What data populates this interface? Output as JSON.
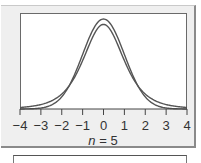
{
  "chart_data": {
    "type": "line",
    "title": "",
    "xlabel": "n = 5",
    "xlabel_var": "n",
    "xlabel_rest": " = 5",
    "ylabel": "",
    "xlim": [
      -4,
      4
    ],
    "grid": false,
    "legend": null,
    "x_ticks": [
      "−4",
      "−3",
      "−2",
      "−1",
      "0",
      "1",
      "2",
      "3",
      "4"
    ],
    "series": [
      {
        "name": "Standard normal distribution",
        "description": "taller peak, thinner tails",
        "x": [
          -4,
          -3,
          -2,
          -1,
          0,
          1,
          2,
          3,
          4
        ],
        "y": [
          0.0001,
          0.0044,
          0.054,
          0.242,
          0.399,
          0.242,
          0.054,
          0.0044,
          0.0001
        ]
      },
      {
        "name": "t-distribution (df = 4)",
        "description": "lower peak, heavier tails",
        "x": [
          -4,
          -3,
          -2,
          -1,
          0,
          1,
          2,
          3,
          4
        ],
        "y": [
          0.0067,
          0.0197,
          0.0663,
          0.2147,
          0.375,
          0.2147,
          0.0663,
          0.0197,
          0.0067
        ]
      }
    ]
  }
}
